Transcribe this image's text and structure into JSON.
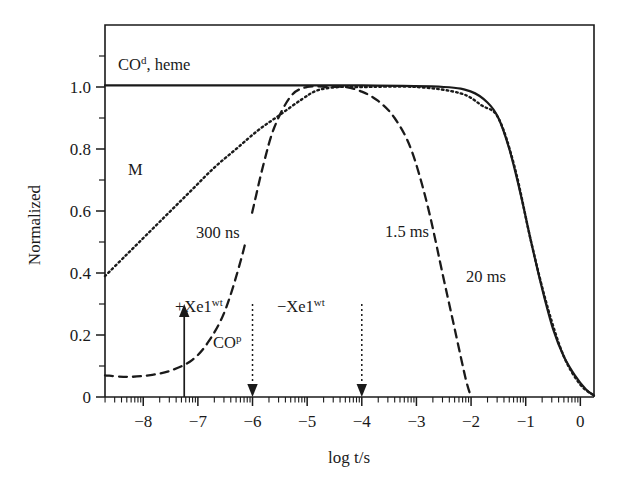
{
  "figure": {
    "ylabel": "Normalized",
    "xlabel": "log t/s"
  },
  "axes": {
    "x_ticklabels": [
      "−8",
      "−7",
      "−6",
      "−5",
      "−4",
      "−3",
      "−2",
      "−1",
      "0"
    ],
    "x_tickvalues": [
      -8,
      -7,
      -6,
      -5,
      -4,
      -3,
      -2,
      -1,
      0
    ],
    "y_ticklabels": [
      "0",
      "0.2",
      "0.4",
      "0.6",
      "0.8",
      "1.0"
    ],
    "y_tickvalues": [
      0,
      0.2,
      0.4,
      0.6,
      0.8,
      1.0
    ]
  },
  "annotations": {
    "co_heme": {
      "base": "CO",
      "sup": "d",
      "tail": ", heme"
    },
    "m_label": "M",
    "t300ns": "300 ns",
    "t15ms": "1.5 ms",
    "t20ms": "20 ms",
    "xe_plus": {
      "base": "+Xe1",
      "sup": "wt"
    },
    "xe_minus": {
      "base": "−Xe1",
      "sup": "wt"
    },
    "co_p": {
      "base": "CO",
      "sup": "p"
    }
  },
  "chart_data": {
    "type": "line",
    "title": "",
    "xlabel": "log t/s",
    "ylabel": "Normalized",
    "xlim": [
      -8.7,
      0.25
    ],
    "ylim": [
      0,
      1.2
    ],
    "grid": false,
    "legend": "none",
    "x_major_ticks": [
      -8,
      -7,
      -6,
      -5,
      -4,
      -3,
      -2,
      -1,
      0
    ],
    "y_major_ticks": [
      0,
      0.2,
      0.4,
      0.6,
      0.8,
      1.0
    ],
    "series": [
      {
        "name": "CO(d), heme",
        "style": "solid",
        "comment": "flat at 1.0 until about log t = -2, then sigmoidal decay to 0 near log t = 0.25",
        "x": [
          -8.7,
          -6.0,
          -4.0,
          -2.5,
          -2.0,
          -1.7,
          -1.5,
          -1.3,
          -1.1,
          -0.9,
          -0.7,
          -0.5,
          -0.3,
          -0.1,
          0.1,
          0.25
        ],
        "y": [
          1.005,
          1.005,
          1.005,
          1.0,
          0.985,
          0.95,
          0.9,
          0.8,
          0.66,
          0.5,
          0.35,
          0.22,
          0.13,
          0.07,
          0.025,
          0.005
        ]
      },
      {
        "name": "M",
        "style": "dotted",
        "comment": "rising sigmoid from 0.39 at left edge to 1.0 near log t = -4.8; then coincides with the solid CO(d) decay",
        "x": [
          -8.7,
          -8.3,
          -7.9,
          -7.5,
          -7.1,
          -6.7,
          -6.3,
          -5.9,
          -5.5,
          -5.1,
          -4.8,
          -4.4,
          -4.0,
          -3.0,
          -2.2,
          -1.8,
          -1.5,
          -1.2,
          -0.9,
          -0.6,
          -0.3,
          0.0,
          0.25
        ],
        "y": [
          0.39,
          0.46,
          0.53,
          0.6,
          0.67,
          0.74,
          0.8,
          0.86,
          0.91,
          0.96,
          0.99,
          1.0,
          1.0,
          1.0,
          0.98,
          0.94,
          0.9,
          0.74,
          0.5,
          0.29,
          0.13,
          0.04,
          0.005
        ]
      },
      {
        "name": "CO(p)",
        "style": "dashed",
        "comment": "starts at 0.07, dips slightly, rises steeply from log t = -7 to plateau 1.0 at log t = -5.3 through -4.3, then falls to 0 at log t = -2",
        "x": [
          -8.7,
          -8.3,
          -7.9,
          -7.5,
          -7.1,
          -6.8,
          -6.5,
          -6.2,
          -6.0,
          -5.8,
          -5.6,
          -5.3,
          -5.0,
          -4.6,
          -4.3,
          -4.0,
          -3.7,
          -3.4,
          -3.1,
          -2.8,
          -2.5,
          -2.3,
          -2.1,
          -2.0
        ],
        "y": [
          0.07,
          0.065,
          0.07,
          0.085,
          0.12,
          0.18,
          0.28,
          0.45,
          0.6,
          0.75,
          0.87,
          0.97,
          1.0,
          1.0,
          1.0,
          0.985,
          0.955,
          0.9,
          0.8,
          0.62,
          0.38,
          0.22,
          0.06,
          0.0
        ]
      }
    ],
    "arrows": [
      {
        "label": "+Xe1(wt)",
        "x": -7.25,
        "style": "solid-up",
        "from_y": 0.0,
        "to_y": 0.3
      },
      {
        "label": "CO(p)",
        "x": -6.0,
        "style": "dotted-down",
        "from_y": 0.3,
        "to_y": 0.0
      },
      {
        "label": "-Xe1(wt)",
        "x": -4.0,
        "style": "dotted-down",
        "from_y": 0.3,
        "to_y": 0.0
      }
    ],
    "time_annotations": [
      {
        "text": "300 ns",
        "near_x": -6.5,
        "near_y": 0.46
      },
      {
        "text": "1.5 ms",
        "near_x": -2.85,
        "near_y": 0.47
      },
      {
        "text": "20 ms",
        "near_x": -1.35,
        "near_y": 0.33
      }
    ]
  }
}
